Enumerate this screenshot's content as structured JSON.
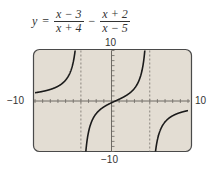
{
  "equation": {
    "lhs": "y",
    "equals": "=",
    "term1": {
      "numerator": "x − 3",
      "denominator": "x + 4"
    },
    "operator": "−",
    "term2": {
      "numerator": "x + 2",
      "denominator": "x − 5"
    }
  },
  "axis_labels": {
    "ymax": "10",
    "ymin": "−10",
    "xmin": "−10",
    "xmax": "10"
  },
  "colors": {
    "panel_bg": "#e3ddd3",
    "frame": "#4a4a4a",
    "curve": "#1a1a1a",
    "axis": "#6e6a64",
    "asymptote": "#8a857e"
  },
  "chart_data": {
    "type": "line",
    "xlabel": "",
    "ylabel": "",
    "xlim": [
      -10,
      10
    ],
    "ylim": [
      -10,
      10
    ],
    "xtick_step": 1,
    "ytick_step": 1,
    "grid": false,
    "vertical_asymptotes": [
      -4,
      5
    ],
    "series": [
      {
        "name": "branch-left",
        "x": [
          -10,
          -9,
          -8,
          -7,
          -6,
          -5.5,
          -5,
          -4.8,
          -4.6,
          -4.5
        ],
        "y": [
          1.63,
          1.86,
          2.18,
          2.62,
          3.32,
          3.8,
          4.8,
          6.27,
          10.13,
          14.1
        ]
      },
      {
        "name": "branch-middle",
        "x": [
          -3.5,
          -3.3,
          -3,
          -2,
          -1,
          0,
          1,
          2,
          3,
          4,
          4.3,
          4.5
        ],
        "y": [
          -12.6,
          -8.8,
          -5.25,
          -1.64,
          -0.5,
          -0.35,
          0.35,
          1.5,
          2.36,
          6.1,
          9.4,
          13.0
        ],
        "y_note": "sampled from formula"
      },
      {
        "name": "branch-right",
        "x": [
          5.5,
          5.8,
          6,
          7,
          8,
          9,
          10
        ],
        "y": [
          -14.8,
          -9.6,
          -7.8,
          -4.2,
          -2.92,
          -2.3,
          -1.9
        ]
      }
    ]
  }
}
